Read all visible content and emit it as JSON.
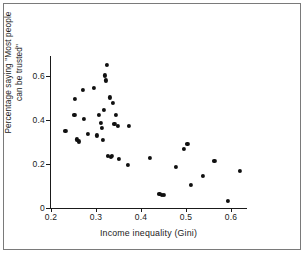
{
  "figure": {
    "width": 304,
    "height": 253,
    "background": "#ffffff",
    "border_color": "#7a7a7a",
    "marker_color": "#101010",
    "axis_color": "#1a1a1a"
  },
  "chart_data": {
    "type": "scatter",
    "title": "",
    "xlabel": "Income inequality (Gini)",
    "ylabel_line1": "Percentage saying \"Most people",
    "ylabel_line2": "can be trusted\"",
    "ylabel": "Percentage saying \"Most people can be trusted\"",
    "xlim": [
      0.185,
      0.625
    ],
    "ylim": [
      0.0,
      0.69
    ],
    "xticks": [
      0.2,
      0.3,
      0.4,
      0.5,
      0.6
    ],
    "xtick_labels": [
      "0.2",
      "0.3",
      "0.4",
      "0.5",
      "0.6"
    ],
    "yticks": [
      0,
      0.2,
      0.4,
      0.6
    ],
    "ytick_labels": [
      "0",
      "0.2",
      "0.4",
      "0.6"
    ],
    "grid": false,
    "legend": null,
    "series": [
      {
        "name": "countries",
        "marker": "circle",
        "color": "#101010",
        "points": [
          [
            0.232,
            0.349
          ],
          [
            0.252,
            0.422
          ],
          [
            0.254,
            0.497
          ],
          [
            0.258,
            0.312
          ],
          [
            0.262,
            0.303
          ],
          [
            0.271,
            0.536
          ],
          [
            0.273,
            0.405
          ],
          [
            0.282,
            0.337
          ],
          [
            0.295,
            0.545
          ],
          [
            0.302,
            0.33
          ],
          [
            0.307,
            0.422
          ],
          [
            0.311,
            0.388
          ],
          [
            0.313,
            0.365
          ],
          [
            0.316,
            0.308
          ],
          [
            0.318,
            0.445
          ],
          [
            0.32,
            0.603
          ],
          [
            0.322,
            0.58
          ],
          [
            0.324,
            0.651
          ],
          [
            0.326,
            0.235
          ],
          [
            0.331,
            0.503
          ],
          [
            0.333,
            0.234
          ],
          [
            0.336,
            0.236
          ],
          [
            0.338,
            0.477
          ],
          [
            0.341,
            0.381
          ],
          [
            0.345,
            0.423
          ],
          [
            0.348,
            0.375
          ],
          [
            0.351,
            0.225
          ],
          [
            0.37,
            0.196
          ],
          [
            0.374,
            0.372
          ],
          [
            0.42,
            0.226
          ],
          [
            0.441,
            0.063
          ],
          [
            0.446,
            0.058
          ],
          [
            0.45,
            0.059
          ],
          [
            0.477,
            0.185
          ],
          [
            0.495,
            0.27
          ],
          [
            0.503,
            0.29
          ],
          [
            0.511,
            0.104
          ],
          [
            0.538,
            0.147
          ],
          [
            0.563,
            0.214
          ],
          [
            0.594,
            0.034
          ],
          [
            0.62,
            0.168
          ]
        ]
      }
    ]
  }
}
